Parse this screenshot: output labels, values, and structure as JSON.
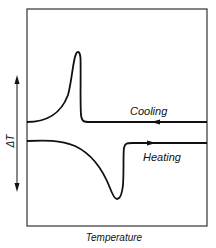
{
  "diagram": {
    "type": "DTA thermogram",
    "y_axis_label": "ΔT",
    "x_axis_label": "Temperature",
    "curves": [
      {
        "name": "Cooling",
        "label": "Cooling",
        "direction": "left",
        "feature": "exothermic peak (up)"
      },
      {
        "name": "Heating",
        "label": "Heating",
        "direction": "right",
        "feature": "endothermic dip (down)"
      }
    ],
    "colors": {
      "line": "#111111",
      "frame": "#333333",
      "background": "#ffffff"
    }
  }
}
